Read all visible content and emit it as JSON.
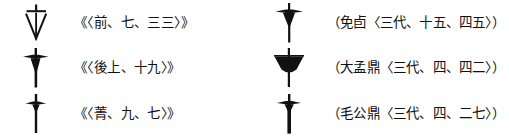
{
  "figure": {
    "ink_color": "#111111",
    "background_color": "#ffffff",
    "columns": 2,
    "rows": 3
  },
  "entries": [
    {
      "id": "entry-1",
      "column": "left",
      "row": 1,
      "glyph_name": "glyph-outlined-inverted-triangle-with-stem",
      "glyph_description": "Outlined inverted triangle blade with vertical stem and short horizontal crossbar at top",
      "citation": "《〈前、七、三三〉》",
      "source_label": "",
      "reference": "〈前、七、三三〉"
    },
    {
      "id": "entry-2",
      "column": "left",
      "row": 2,
      "glyph_name": "glyph-solid-tapered-blade-with-crossbar",
      "glyph_description": "Solid tapered blade with long vertical stem and horizontal crossbar near top",
      "citation": "《〈後上、十九〉》",
      "source_label": "",
      "reference": "〈後上、十九〉"
    },
    {
      "id": "entry-3",
      "column": "left",
      "row": 3,
      "glyph_name": "glyph-slender-cross-with-stem",
      "glyph_description": "Slender vertical stem with narrow horizontal crossbar near top, dagger-like",
      "citation": "《〈菁、九、七〉》",
      "source_label": "",
      "reference": "〈菁、九、七〉"
    },
    {
      "id": "entry-4",
      "column": "right",
      "row": 1,
      "glyph_name": "glyph-winged-crossbar-with-solid-blade",
      "glyph_description": "Tapered crossbar wings with solid downward blade and vertical stem",
      "citation": "（免卣〈三代、十五、四五〉）",
      "source_label": "免卣",
      "reference": "〈三代、十五、四五〉"
    },
    {
      "id": "entry-5",
      "column": "right",
      "row": 2,
      "glyph_name": "glyph-solid-wide-bowl-with-stem",
      "glyph_description": "Wide solid bowl or fan shape pierced by a vertical stem with crossbar",
      "citation": "（大孟鼎〈三代、四、四二〉）",
      "source_label": "大孟鼎",
      "reference": "〈三代、四、四二〉"
    },
    {
      "id": "entry-6",
      "column": "right",
      "row": 3,
      "glyph_name": "glyph-crossbar-with-thick-stem",
      "glyph_description": "Narrow crossbar wings over a thick vertical stem with small solid head",
      "citation": "（毛公鼎〈三代、四、二七〉）",
      "source_label": "毛公鼎",
      "reference": "〈三代、四、二七〉"
    }
  ]
}
